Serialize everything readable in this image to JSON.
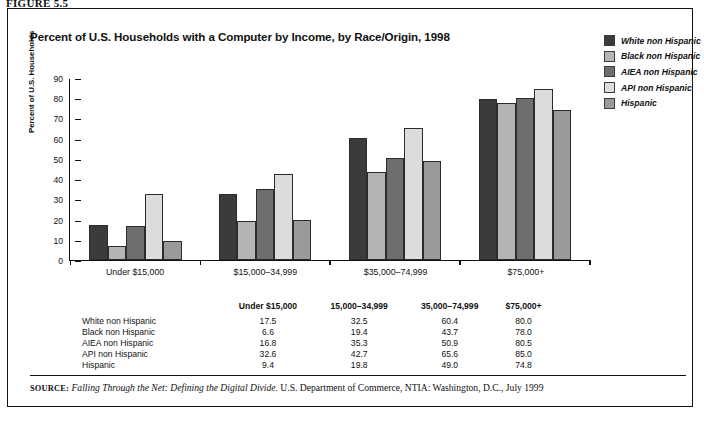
{
  "figure_label": "FIGURE 5.5",
  "chart_title": "Percent of U.S. Households with a Computer by Income, by Race/Origin, 1998",
  "source": {
    "prefix": "SOURCE:",
    "italic_part": "Falling Through the Net: Defining the Digital Divide.",
    "rest": " U.S. Department of Commerce, NTIA: Washington, D.C., July 1999"
  },
  "legend": {
    "items": [
      {
        "label": "White non Hispanic",
        "color": "#3b3b3b"
      },
      {
        "label": "Black non Hispanic",
        "color": "#b4b4b4"
      },
      {
        "label": "AIEA non Hispanic",
        "color": "#6e6e6e"
      },
      {
        "label": "API non Hispanic",
        "color": "#dcdcdc"
      },
      {
        "label": "Hispanic",
        "color": "#9a9a9a"
      }
    ]
  },
  "table": {
    "row_header_label": "",
    "columns": [
      "Under $15,000",
      "15,000–34,999",
      "35,000–74,999",
      "$75,000+"
    ],
    "rows": [
      {
        "name": "White non Hispanic",
        "values": [
          "17.5",
          "32.5",
          "60.4",
          "80.0"
        ]
      },
      {
        "name": "Black non Hispanic",
        "values": [
          "6.6",
          "19.4",
          "43.7",
          "78.0"
        ]
      },
      {
        "name": "AIEA non Hispanic",
        "values": [
          "16.8",
          "35.3",
          "50.9",
          "80.5"
        ]
      },
      {
        "name": "API non Hispanic",
        "values": [
          "32.6",
          "42.7",
          "65.6",
          "85.0"
        ]
      },
      {
        "name": "Hispanic",
        "values": [
          "9.4",
          "19.8",
          "49.0",
          "74.8"
        ]
      }
    ]
  },
  "chart_data": {
    "type": "bar",
    "title": "Percent of U.S. Households with a Computer by Income, by Race/Origin, 1998",
    "xlabel": "",
    "ylabel": "Percent of U.S. Households",
    "ylim": [
      0,
      90
    ],
    "yticks": [
      0,
      10,
      20,
      30,
      40,
      50,
      60,
      70,
      80,
      90
    ],
    "grid": false,
    "legend_position": "top-right",
    "categories": [
      "Under $15,000",
      "$15,000–34,999",
      "$35,000–74,999",
      "$75,000+"
    ],
    "series": [
      {
        "name": "White non Hispanic",
        "color": "#3b3b3b",
        "values": [
          17.5,
          32.5,
          60.4,
          80.0
        ]
      },
      {
        "name": "Black non Hispanic",
        "color": "#b4b4b4",
        "values": [
          6.6,
          19.4,
          43.7,
          78.0
        ]
      },
      {
        "name": "AIEA non Hispanic",
        "color": "#6e6e6e",
        "values": [
          16.8,
          35.3,
          50.9,
          80.5
        ]
      },
      {
        "name": "API non Hispanic",
        "color": "#dcdcdc",
        "values": [
          32.6,
          42.7,
          65.6,
          85.0
        ]
      },
      {
        "name": "Hispanic",
        "color": "#9a9a9a",
        "values": [
          9.4,
          19.8,
          49.0,
          74.8
        ]
      }
    ]
  }
}
